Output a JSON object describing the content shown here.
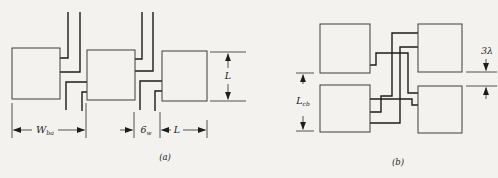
{
  "page": {
    "background": "#f3f2ee"
  },
  "figure": {
    "ink": "#1c1c1c",
    "square_stroke": "#3d3d3d",
    "dim_stroke": "#2a2a2a",
    "subfigures": [
      {
        "id": "a",
        "caption": "(a)",
        "squares": [
          [
            12,
            48,
            48,
            51
          ],
          [
            87,
            50,
            48,
            50
          ],
          [
            162,
            51,
            45,
            50
          ]
        ],
        "wires": [
          [
            [
              68,
              12
            ],
            [
              68,
              58
            ],
            [
              60,
              58
            ]
          ],
          [
            [
              80,
              12
            ],
            [
              80,
              72
            ],
            [
              60,
              72
            ]
          ],
          [
            [
              66,
              110
            ],
            [
              66,
              82
            ],
            [
              87,
              82
            ]
          ],
          [
            [
              82,
              111
            ],
            [
              82,
              92
            ],
            [
              87,
              92
            ]
          ],
          [
            [
              142,
              12
            ],
            [
              142,
              59
            ],
            [
              135,
              59
            ]
          ],
          [
            [
              153,
              12
            ],
            [
              153,
              71
            ],
            [
              135,
              71
            ]
          ],
          [
            [
              140,
              110
            ],
            [
              140,
              81
            ],
            [
              162,
              81
            ]
          ],
          [
            [
              155,
              111
            ],
            [
              155,
              91
            ],
            [
              162,
              91
            ]
          ]
        ],
        "dim_ticks": [
          [
            12,
            103,
            12,
            138
          ],
          [
            86,
            103,
            86,
            138
          ],
          [
            134,
            112,
            134,
            138
          ],
          [
            160,
            112,
            160,
            138
          ],
          [
            207,
            120,
            207,
            138
          ],
          [
            210,
            52,
            246,
            52
          ],
          [
            210,
            101,
            246,
            101
          ]
        ],
        "dim_arrows": [
          [
            32,
            130,
            13.5,
            130
          ],
          [
            58,
            130,
            84.5,
            130
          ],
          [
            120,
            130,
            132.5,
            130
          ],
          [
            171,
            130,
            161.5,
            130
          ],
          [
            183,
            130,
            205.5,
            130
          ],
          [
            228,
            68,
            228,
            53.8
          ],
          [
            228,
            84,
            228,
            99.3
          ]
        ],
        "labels": [
          {
            "name": "label-w-ba",
            "x": 45,
            "y": 133,
            "main": "W",
            "sub": "ba",
            "size": 10
          },
          {
            "name": "label-6-w",
            "x": 146,
            "y": 133,
            "main": "6",
            "sub": "w",
            "size": 9.5
          },
          {
            "name": "label-l-horizontal",
            "x": 177,
            "y": 133,
            "main": "L",
            "sub": "",
            "size": 9.5
          },
          {
            "name": "label-l-vertical",
            "x": 228,
            "y": 79,
            "main": "L",
            "sub": "",
            "size": 9.5
          },
          {
            "name": "caption-a",
            "x": 165,
            "y": 160,
            "main": "(a)",
            "sub": "",
            "size": 8.5
          }
        ]
      },
      {
        "id": "b",
        "caption": "(b)",
        "squares": [
          [
            320,
            24,
            50,
            49
          ],
          [
            418,
            24,
            44,
            48
          ],
          [
            320,
            85,
            50,
            47
          ],
          [
            418,
            86,
            44,
            47
          ]
        ],
        "wires": [
          [
            [
              418,
              33
            ],
            [
              392,
              33
            ],
            [
              392,
              96
            ],
            [
              381,
              96
            ],
            [
              381,
              112
            ],
            [
              370,
              112
            ]
          ],
          [
            [
              418,
              47
            ],
            [
              400,
              47
            ],
            [
              400,
              123
            ],
            [
              370,
              123
            ]
          ],
          [
            [
              370,
              65
            ],
            [
              376,
              65
            ],
            [
              376,
              53
            ],
            [
              408,
              53
            ],
            [
              408,
              93
            ],
            [
              418,
              93
            ]
          ],
          [
            [
              370,
              99
            ],
            [
              412,
              99
            ],
            [
              412,
              105
            ],
            [
              418,
              105
            ]
          ]
        ],
        "dim_ticks": [
          [
            296,
            73,
            314,
            73
          ],
          [
            296,
            131,
            314,
            131
          ],
          [
            466,
            72,
            497,
            72
          ],
          [
            466,
            86,
            497,
            86
          ]
        ],
        "dim_arrows": [
          [
            303,
            84,
            303,
            74.7
          ],
          [
            303,
            116,
            303,
            129.3
          ],
          [
            486,
            59,
            486,
            70.5
          ],
          [
            486,
            99,
            486,
            87.5
          ]
        ],
        "labels": [
          {
            "name": "label-l-cb",
            "x": 303,
            "y": 104,
            "main": "L",
            "sub": "cb",
            "size": 9.5
          },
          {
            "name": "label-3-lambda",
            "x": 487,
            "y": 54,
            "main": "3λ",
            "sub": "",
            "size": 9.5
          },
          {
            "name": "caption-b",
            "x": 398,
            "y": 165,
            "main": "(b)",
            "sub": "",
            "size": 8.5
          }
        ]
      }
    ]
  }
}
